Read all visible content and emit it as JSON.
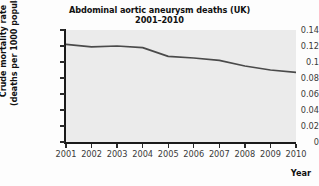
{
  "chart_data": {
    "type": "line",
    "title": "Abdominal aortic aneurysm deaths (UK)",
    "subtitle": "2001–2010",
    "title_lines": [
      "Abdominal aortic aneurysm deaths (UK)",
      "2001–2010"
    ],
    "xlabel": "Year",
    "ylabel": "Crude mortality rate (deaths per 1000 population)",
    "ylabel_lines": [
      "Crude mortality rate",
      "(deaths per 1000 population)"
    ],
    "categories": [
      "2001",
      "2002",
      "2003",
      "2004",
      "2005",
      "2006",
      "2007",
      "2008",
      "2009",
      "2010"
    ],
    "x": [
      2001,
      2002,
      2003,
      2004,
      2005,
      2006,
      2007,
      2008,
      2009,
      2010
    ],
    "values": [
      0.122,
      0.119,
      0.12,
      0.118,
      0.107,
      0.105,
      0.102,
      0.095,
      0.09,
      0.087
    ],
    "series": [
      {
        "name": "Crude mortality rate",
        "values": [
          0.122,
          0.119,
          0.12,
          0.118,
          0.107,
          0.105,
          0.102,
          0.095,
          0.09,
          0.087
        ]
      }
    ],
    "ylim": [
      0,
      0.14
    ],
    "xlim": [
      2001,
      2010
    ],
    "ytick_labels": [
      "0.14",
      "0.12",
      "0.1",
      "0.08",
      "0.06",
      "0.04",
      "0.02",
      "0"
    ],
    "ytick_values": [
      0.14,
      0.12,
      0.1,
      0.08,
      0.06,
      0.04,
      0.02,
      0
    ],
    "xtick_labels": [
      "2001",
      "2002",
      "2003",
      "2004",
      "2005",
      "2006",
      "2007",
      "2008",
      "2009",
      "2010"
    ],
    "grid": false,
    "legend": null,
    "legend_position": "none",
    "line_color": "#4a4a4a",
    "plot_background": "#ebebeb",
    "figure_background": "#fdfdfd",
    "axis_color": "#1a1a1a"
  }
}
